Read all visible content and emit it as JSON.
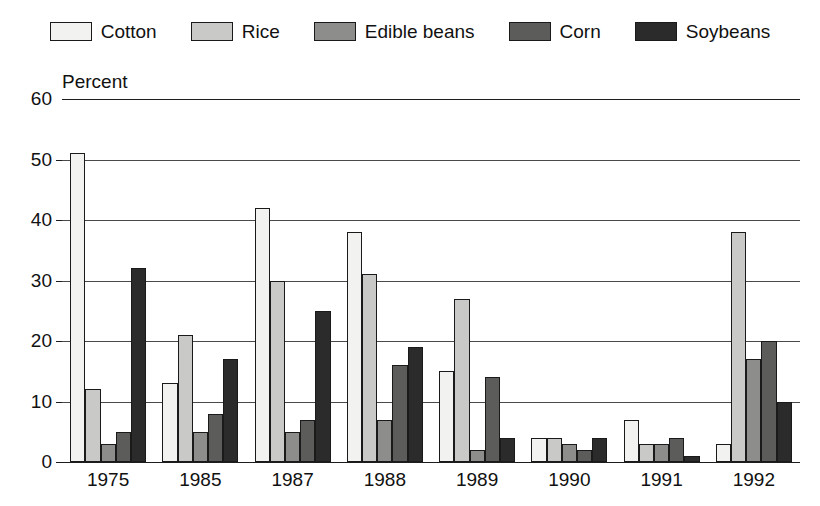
{
  "legend": {
    "entries": [
      {
        "label": "Cotton",
        "color": "#f2f2f0"
      },
      {
        "label": "Rice",
        "color": "#c9c9c7"
      },
      {
        "label": "Edible beans",
        "color": "#8d8d8b"
      },
      {
        "label": "Corn",
        "color": "#5c5c5a"
      },
      {
        "label": "Soybeans",
        "color": "#2b2b2b"
      }
    ]
  },
  "axis": {
    "y_title": "Percent",
    "y_ticks": [
      "0",
      "10",
      "20",
      "30",
      "40",
      "50",
      "60"
    ]
  },
  "chart_data": {
    "type": "bar",
    "title": "",
    "xlabel": "",
    "ylabel": "Percent",
    "ylim": [
      0,
      60
    ],
    "ytick_values": [
      0,
      10,
      20,
      30,
      40,
      50,
      60
    ],
    "grid": true,
    "legend_position": "top",
    "categories": [
      "1975",
      "1985",
      "1987",
      "1988",
      "1989",
      "1990",
      "1991",
      "1992"
    ],
    "series": [
      {
        "name": "Cotton",
        "color": "#f2f2f0",
        "values": [
          51,
          13,
          42,
          38,
          15,
          4,
          7,
          3
        ]
      },
      {
        "name": "Rice",
        "color": "#c9c9c7",
        "values": [
          12,
          21,
          30,
          31,
          27,
          4,
          3,
          38
        ]
      },
      {
        "name": "Edible beans",
        "color": "#8d8d8b",
        "values": [
          3,
          5,
          5,
          7,
          2,
          3,
          3,
          17
        ]
      },
      {
        "name": "Corn",
        "color": "#5c5c5a",
        "values": [
          5,
          8,
          7,
          16,
          14,
          2,
          4,
          20
        ]
      },
      {
        "name": "Soybeans",
        "color": "#2b2b2b",
        "values": [
          32,
          17,
          25,
          19,
          4,
          4,
          1,
          10
        ]
      }
    ]
  }
}
